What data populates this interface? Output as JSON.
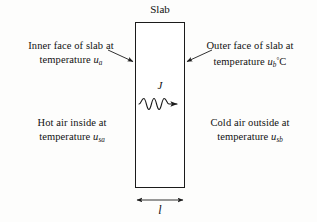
{
  "figure": {
    "title": "Slab",
    "background_color": "#fdfdfc",
    "line_color": "#1b1b1b",
    "text_color": "#111111"
  },
  "slab": {
    "title": "Slab",
    "thickness_symbol": "l",
    "flux_symbol": "J"
  },
  "labels": {
    "inner": {
      "line1": "Inner face of slab at",
      "line2_prefix": "temperature ",
      "line2_symbol": "u",
      "line2_subscript": "a",
      "line2_suffix": ""
    },
    "outer": {
      "line1": "Outer face of slab at",
      "line2_prefix": "temperature ",
      "line2_symbol": "u",
      "line2_subscript": "b",
      "line2_degree": "°",
      "line2_suffix": "C"
    },
    "hot": {
      "line1": "Hot air inside at",
      "line2_prefix": "temperature ",
      "line2_symbol": "u",
      "line2_subscript": "sa",
      "line2_suffix": ""
    },
    "cold": {
      "line1": "Cold air outside at",
      "line2_prefix": "temperature ",
      "line2_symbol": "u",
      "line2_subscript": "sb",
      "line2_suffix": ""
    }
  },
  "annotations": {
    "flux_arrow": "wavy-arrow-right",
    "dimension_arrow": "double-headed-arrow",
    "pointer_left": "arrow-to-inner-face",
    "pointer_right": "arrow-to-outer-face"
  }
}
